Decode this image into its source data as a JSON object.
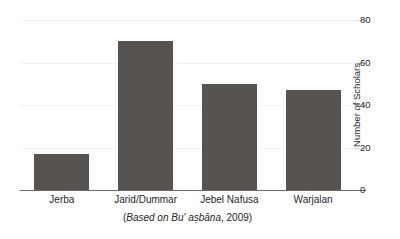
{
  "chart_data": {
    "type": "bar",
    "title": "",
    "subtitle": "",
    "xlabel": "",
    "ylabel": "Number of Scholars",
    "categories": [
      "Jerba",
      "Jarid/Dummar",
      "Jebel Nafusa",
      "Warjalan"
    ],
    "values": [
      17,
      70,
      50,
      47
    ],
    "ylim": [
      0,
      80
    ],
    "yticks": [
      0,
      20,
      40,
      60,
      80
    ],
    "ytick_labels": [
      "0",
      "20",
      "40",
      "60",
      "80"
    ],
    "grid": true,
    "grid_axis": "y",
    "legend": false,
    "legend_position": "none",
    "bar_color": "#575350",
    "gridline_color": "#f2f2f2",
    "axis_color": "#6e6a66",
    "text_color": "#262626",
    "caption": {
      "open_paren": "(",
      "italic_part": "Based on Bu' aṣbāna",
      "tail": ", 2009)"
    },
    "annotations": []
  }
}
